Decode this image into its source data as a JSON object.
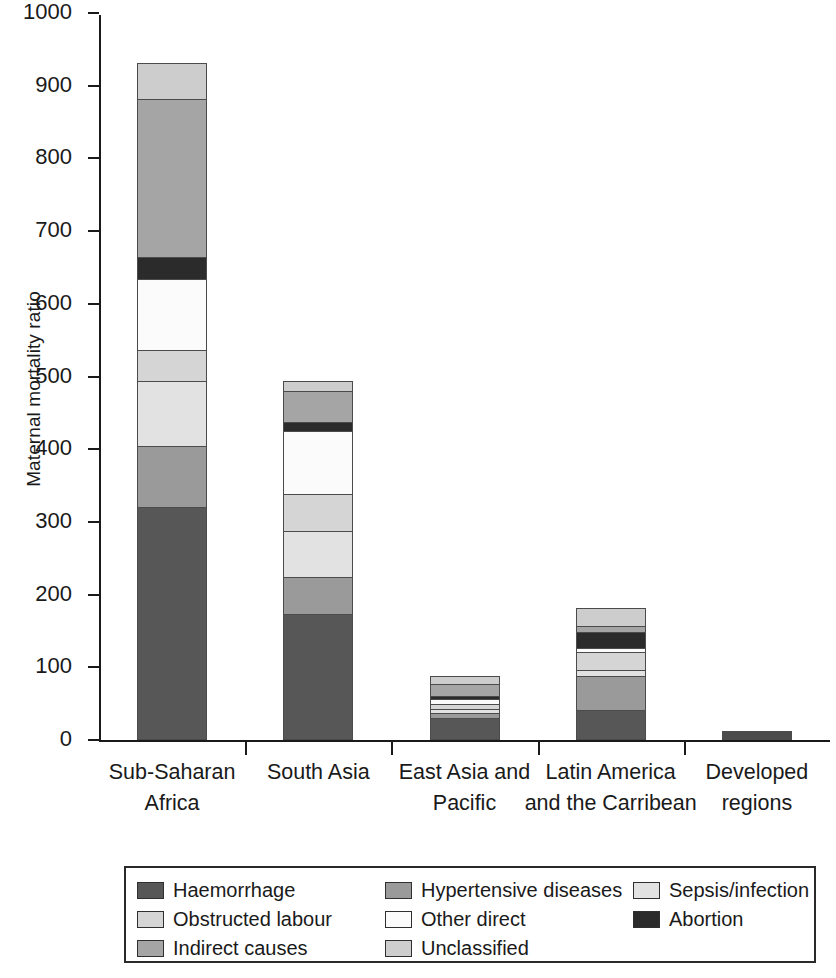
{
  "chart_data": {
    "type": "bar",
    "subtype": "stacked-vertical",
    "title": "",
    "xlabel": "",
    "ylabel": "Maternal mortality ratio",
    "ylim": [
      0,
      1000
    ],
    "yticks": [
      0,
      100,
      200,
      300,
      400,
      500,
      600,
      700,
      800,
      900,
      1000
    ],
    "ytick_labels": [
      "0",
      "100",
      "200",
      "300",
      "400",
      "500",
      "600",
      "700",
      "800",
      "900",
      "1000"
    ],
    "grid": false,
    "legend_position": "bottom",
    "categories": [
      "Sub-Saharan Africa",
      "South Asia",
      "East Asia and Pacific",
      "Latin America and the Carribean",
      "Developed regions"
    ],
    "category_lines": [
      [
        "Sub-Saharan",
        "Africa"
      ],
      [
        "South Asia"
      ],
      [
        "East Asia and",
        "Pacific"
      ],
      [
        "Latin America",
        "and the Carribean"
      ],
      [
        "Developed",
        "regions"
      ]
    ],
    "series": [
      {
        "name": "Haemorrhage",
        "color": "#575757",
        "values": [
          320,
          174,
          30,
          41,
          2.5
        ]
      },
      {
        "name": "Hypertensive diseases",
        "color": "#9a9a9a",
        "values": [
          86,
          52,
          9,
          49,
          1.0
        ]
      },
      {
        "name": "Sepsis/infection",
        "color": "#e2e2e2",
        "values": [
          90,
          64,
          7,
          9,
          0.8
        ]
      },
      {
        "name": "Obstructed labour",
        "color": "#d5d5d5",
        "values": [
          44,
          53,
          8,
          26,
          0.7
        ]
      },
      {
        "name": "Other direct",
        "color": "#fbfbfb",
        "values": [
          100,
          88,
          8,
          7,
          0.5
        ]
      },
      {
        "name": "Abortion",
        "color": "#2b2b2b",
        "values": [
          32,
          13,
          5,
          24,
          0.5
        ]
      },
      {
        "name": "Indirect causes",
        "color": "#a5a5a5",
        "values": [
          218,
          45,
          18,
          9,
          1.5
        ]
      },
      {
        "name": "Unclassified",
        "color": "#cdcdcd",
        "values": [
          51,
          14,
          13,
          26,
          1.5
        ]
      }
    ],
    "totals": [
      941,
      503,
      98,
      191,
      9
    ]
  },
  "legend": {
    "items": [
      {
        "label": "Haemorrhage",
        "color": "#575757"
      },
      {
        "label": "Hypertensive diseases",
        "color": "#9a9a9a"
      },
      {
        "label": "Sepsis/infection",
        "color": "#e2e2e2"
      },
      {
        "label": "Obstructed labour",
        "color": "#d5d5d5"
      },
      {
        "label": "Other direct",
        "color": "#fbfbfb"
      },
      {
        "label": "Abortion",
        "color": "#2b2b2b"
      },
      {
        "label": "Indirect causes",
        "color": "#a5a5a5"
      },
      {
        "label": "Unclassified",
        "color": "#cdcdcd"
      }
    ],
    "order": [
      0,
      1,
      2,
      3,
      4,
      5,
      6,
      7
    ]
  },
  "style": {
    "axis_color": "#1a1a1a",
    "segment_border": "#4b4b4b",
    "background": "#ffffff"
  }
}
